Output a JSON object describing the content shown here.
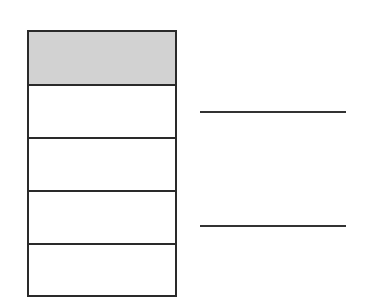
{
  "diagram": {
    "stack": {
      "cells": [
        {
          "index": 0,
          "shaded": true,
          "fill": "#d2d2d2",
          "label": ""
        },
        {
          "index": 1,
          "shaded": false,
          "fill": "#ffffff",
          "label": ""
        },
        {
          "index": 2,
          "shaded": false,
          "fill": "#ffffff",
          "label": ""
        },
        {
          "index": 3,
          "shaded": false,
          "fill": "#ffffff",
          "label": ""
        },
        {
          "index": 4,
          "shaded": false,
          "fill": "#ffffff",
          "label": ""
        }
      ],
      "border_color": "#2a2a2a"
    },
    "answer_lines": [
      {
        "index": 0,
        "label": ""
      },
      {
        "index": 1,
        "label": ""
      }
    ]
  }
}
